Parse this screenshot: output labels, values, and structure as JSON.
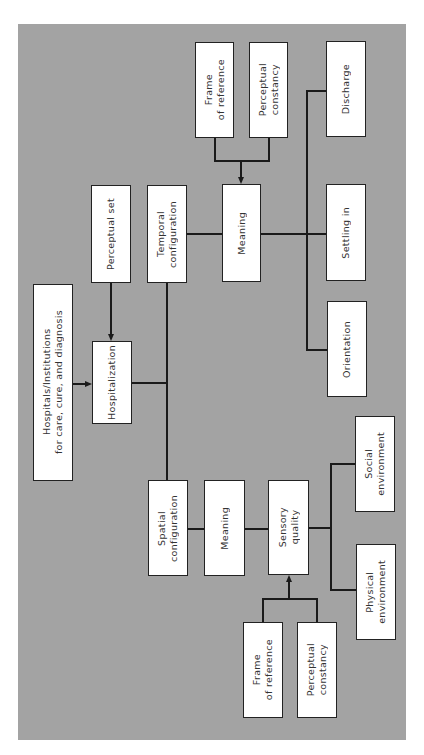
{
  "diagram": {
    "background_color": "#a3a3a3",
    "nodes": {
      "hospitals": {
        "label": "Hospitals/Institutions\nfor care, cure, and diagnosis"
      },
      "hospitalization": {
        "label": "Hospitalization"
      },
      "perceptual_set": {
        "label": "Perceptual set"
      },
      "temporal_configuration": {
        "label": "Temporal\nconfiguration"
      },
      "meaning_temporal": {
        "label": "Meaning"
      },
      "frame_of_reference_top": {
        "label": "Frame\nof reference"
      },
      "perceptual_constancy_top": {
        "label": "Perceptual\nconstancy"
      },
      "discharge": {
        "label": "Discharge"
      },
      "settling_in": {
        "label": "Settling in"
      },
      "orientation": {
        "label": "Orientation"
      },
      "spatial_configuration": {
        "label": "Spatial\nconfiguration"
      },
      "meaning_spatial": {
        "label": "Meaning"
      },
      "sensory_quality": {
        "label": "Sensory\nquality"
      },
      "social_environment": {
        "label": "Social\nenvironment"
      },
      "physical_environment": {
        "label": "Physical\nenvironment"
      },
      "frame_of_reference_bottom": {
        "label": "Frame\nof reference"
      },
      "perceptual_constancy_bottom": {
        "label": "Perceptual\nconstancy"
      }
    },
    "edges": [
      {
        "from": "hospitals",
        "to": "hospitalization",
        "arrow": true
      },
      {
        "from": "perceptual_set",
        "to": "hospitalization",
        "arrow": true
      },
      {
        "from": "hospitalization",
        "to": "temporal_configuration",
        "arrow": false
      },
      {
        "from": "hospitalization",
        "to": "spatial_configuration",
        "arrow": false
      },
      {
        "from": "temporal_configuration",
        "to": "meaning_temporal",
        "arrow": false
      },
      {
        "from": "frame_of_reference_top",
        "to": "meaning_temporal",
        "arrow": true
      },
      {
        "from": "perceptual_constancy_top",
        "to": "meaning_temporal",
        "arrow": true
      },
      {
        "from": "meaning_temporal",
        "to": "discharge",
        "arrow": false
      },
      {
        "from": "meaning_temporal",
        "to": "settling_in",
        "arrow": false
      },
      {
        "from": "meaning_temporal",
        "to": "orientation",
        "arrow": false
      },
      {
        "from": "spatial_configuration",
        "to": "meaning_spatial",
        "arrow": false
      },
      {
        "from": "meaning_spatial",
        "to": "sensory_quality",
        "arrow": false
      },
      {
        "from": "frame_of_reference_bottom",
        "to": "sensory_quality",
        "arrow": true
      },
      {
        "from": "perceptual_constancy_bottom",
        "to": "sensory_quality",
        "arrow": true
      },
      {
        "from": "sensory_quality",
        "to": "social_environment",
        "arrow": false
      },
      {
        "from": "sensory_quality",
        "to": "physical_environment",
        "arrow": false
      }
    ]
  }
}
